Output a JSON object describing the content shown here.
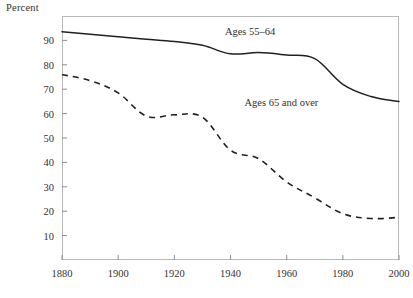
{
  "chart_data": {
    "type": "line",
    "title": "",
    "ylabel": "Percent",
    "xlabel": "",
    "xlim": [
      1880,
      2000
    ],
    "ylim": [
      0,
      100
    ],
    "grid": false,
    "legend_position": "inline-annotation",
    "x_ticks": [
      "1880",
      "1900",
      "1920",
      "1940",
      "1960",
      "1980",
      "2000"
    ],
    "y_ticks": [
      "10",
      "20",
      "30",
      "40",
      "50",
      "60",
      "70",
      "80",
      "90"
    ],
    "series": [
      {
        "name": "Ages 55–64",
        "style": "solid",
        "color": "#231f1e",
        "x": [
          1880,
          1890,
          1900,
          1910,
          1920,
          1930,
          1940,
          1950,
          1960,
          1970,
          1980,
          1990,
          2000
        ],
        "values": [
          93.5,
          92.5,
          91.5,
          90.5,
          89.5,
          88.0,
          84.5,
          85.0,
          84.0,
          82.5,
          72.0,
          67.0,
          65.0
        ]
      },
      {
        "name": "Ages 65 and over",
        "style": "dashed",
        "color": "#231f1e",
        "x": [
          1880,
          1890,
          1900,
          1910,
          1920,
          1930,
          1940,
          1950,
          1960,
          1970,
          1980,
          1990,
          2000
        ],
        "values": [
          76.0,
          73.5,
          68.5,
          59.0,
          59.5,
          58.5,
          45.0,
          41.5,
          32.0,
          25.5,
          19.0,
          17.0,
          17.5
        ]
      }
    ],
    "annotations": [
      {
        "text": "Ages 55–64",
        "x": 1938,
        "y": 93
      },
      {
        "text": "Ages 65 and over",
        "x": 1945,
        "y": 64
      }
    ]
  }
}
